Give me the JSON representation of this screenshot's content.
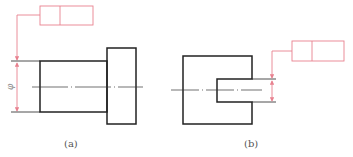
{
  "figures": [
    {
      "id": "a",
      "caption": "(a)",
      "dimension_symbol": "φ"
    },
    {
      "id": "b",
      "caption": "(b)"
    }
  ],
  "colors": {
    "outline": "#222222",
    "annotation": "#e8818f",
    "caption": "#555555"
  }
}
